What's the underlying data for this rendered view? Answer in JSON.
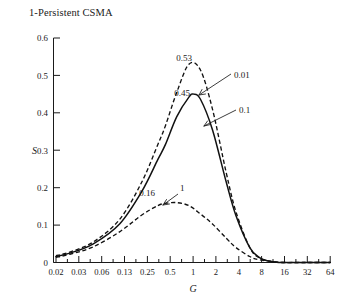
{
  "chart_data": {
    "type": "line",
    "title": "1-Persistent CSMA",
    "xlabel": "G",
    "ylabel": "S",
    "xscale": "log",
    "xlim": [
      0.02,
      64
    ],
    "ylim": [
      0,
      0.6
    ],
    "grid": false,
    "legend_position": "inline-annotations",
    "xticks": [
      "0.02",
      "0.03",
      "0.06",
      "0.13",
      "0.25",
      "0.5",
      "1",
      "2",
      "4",
      "8",
      "16",
      "32",
      "64"
    ],
    "xtick_values": [
      0.02,
      0.03,
      0.06,
      0.13,
      0.25,
      0.5,
      1,
      2,
      4,
      8,
      16,
      32,
      64
    ],
    "yticks": [
      "0",
      "0.1",
      "0.2",
      "0.3",
      "0.4",
      "0.5",
      "0.6"
    ],
    "ytick_values": [
      0,
      0.1,
      0.2,
      0.3,
      0.4,
      0.5,
      0.6
    ],
    "series": [
      {
        "name": "0.01",
        "style": "dashed",
        "peak_label": "0.53",
        "peak": {
          "x": 1.0,
          "y": 0.53
        },
        "x": [
          0.02,
          0.03,
          0.06,
          0.13,
          0.25,
          0.4,
          0.5,
          0.7,
          1.0,
          1.4,
          2.0,
          3.0,
          4.0,
          6.0,
          8.0,
          12.0,
          16.0,
          32.0,
          64.0
        ],
        "y": [
          0.018,
          0.028,
          0.055,
          0.115,
          0.215,
          0.315,
          0.365,
          0.455,
          0.53,
          0.515,
          0.41,
          0.24,
          0.135,
          0.04,
          0.012,
          0.002,
          0.0,
          0.0,
          0.0
        ]
      },
      {
        "name": "0.1",
        "style": "solid",
        "peak_label": "0.45",
        "peak": {
          "x": 1.15,
          "y": 0.45
        },
        "x": [
          0.02,
          0.03,
          0.06,
          0.13,
          0.25,
          0.4,
          0.5,
          0.7,
          1.0,
          1.15,
          1.4,
          2.0,
          3.0,
          4.0,
          6.0,
          8.0,
          10.0,
          12.0,
          16.0,
          32.0,
          64.0
        ],
        "y": [
          0.016,
          0.025,
          0.05,
          0.103,
          0.19,
          0.275,
          0.315,
          0.39,
          0.442,
          0.45,
          0.437,
          0.355,
          0.215,
          0.125,
          0.04,
          0.013,
          0.005,
          0.002,
          0.0,
          0.0,
          0.0
        ]
      },
      {
        "name": "1",
        "style": "dashed",
        "peak_label": "0.16",
        "peak": {
          "x": 0.7,
          "y": 0.16
        },
        "x": [
          0.02,
          0.03,
          0.06,
          0.13,
          0.25,
          0.4,
          0.5,
          0.7,
          1.0,
          1.4,
          2.0,
          3.0,
          4.0,
          6.0,
          8.0,
          16.0,
          32.0,
          64.0
        ],
        "y": [
          0.014,
          0.022,
          0.042,
          0.082,
          0.127,
          0.152,
          0.158,
          0.16,
          0.152,
          0.13,
          0.103,
          0.065,
          0.04,
          0.016,
          0.007,
          0.0,
          0.0,
          0.0
        ]
      }
    ],
    "annotations": [
      {
        "text": "0.53",
        "for_series": "0.01",
        "kind": "peak-value"
      },
      {
        "text": "0.45",
        "for_series": "0.1",
        "kind": "peak-value"
      },
      {
        "text": "0.16",
        "for_series": "1",
        "kind": "peak-value"
      },
      {
        "text": "0.01",
        "for_series": "0.01",
        "kind": "series-callout"
      },
      {
        "text": "0.1",
        "for_series": "0.1",
        "kind": "series-callout"
      },
      {
        "text": "1",
        "for_series": "1",
        "kind": "series-callout"
      }
    ]
  }
}
